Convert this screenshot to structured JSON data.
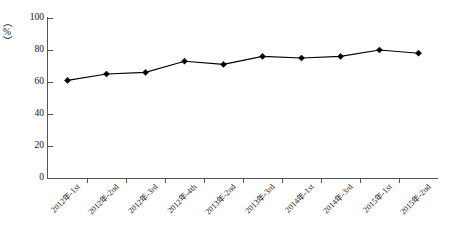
{
  "chart_data": {
    "type": "line",
    "title": "",
    "subtitle": "",
    "xlabel": "",
    "ylabel": "（%）",
    "ylim": [
      0,
      100
    ],
    "yticks": [
      0,
      20,
      40,
      60,
      80,
      100
    ],
    "grid": false,
    "legend": "none",
    "marker": "diamond",
    "line_color": "#000000",
    "marker_color": "#000000",
    "axis_color": "#555555",
    "categories": [
      "2012年-1st",
      "2012年-2nd",
      "2012年-3rd",
      "2012年-4th",
      "2013年-2nd",
      "2013年-3rd",
      "2014年-1st",
      "2014年-3rd",
      "2015年-1st",
      "2015年-2nd"
    ],
    "values": [
      61,
      65,
      66,
      73,
      71,
      76,
      75,
      76,
      80,
      78
    ],
    "series": [
      {
        "name": "",
        "values": [
          61,
          65,
          66,
          73,
          71,
          76,
          75,
          76,
          80,
          78
        ]
      }
    ]
  },
  "axis": {
    "y_title": "（%）",
    "tick_labels_y": [
      "100",
      "80",
      "60",
      "40",
      "20",
      "0"
    ]
  }
}
